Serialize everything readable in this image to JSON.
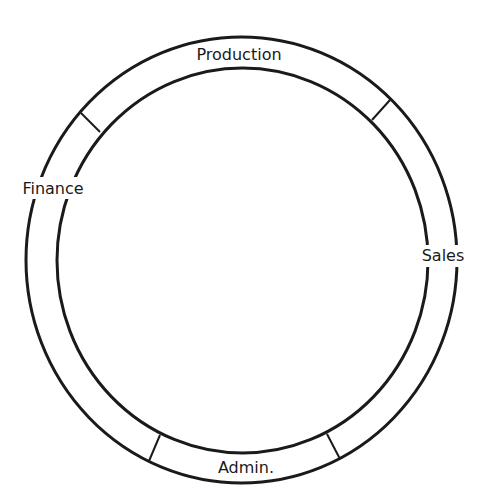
{
  "diagram": {
    "type": "ring-diagram",
    "stroke_color": "#1a1a1a",
    "background": "#ffffff",
    "segments": [
      {
        "label": "Production",
        "position": "top"
      },
      {
        "label": "Sales",
        "position": "right"
      },
      {
        "label": "Admin.",
        "position": "bottom"
      },
      {
        "label": "Finance",
        "position": "left"
      }
    ]
  }
}
